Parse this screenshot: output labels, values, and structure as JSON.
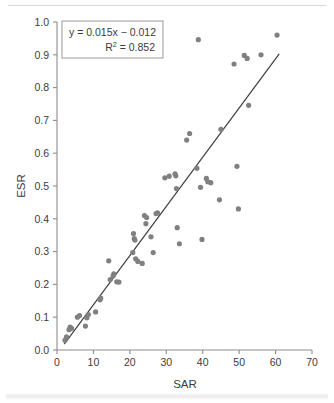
{
  "chart_data": {
    "type": "scatter",
    "title": "",
    "xlabel": "SAR",
    "ylabel": "ESR",
    "xlim": [
      0,
      70
    ],
    "ylim": [
      0.0,
      1.0
    ],
    "xticks": [
      "0",
      "10",
      "20",
      "30",
      "40",
      "50",
      "60",
      "70"
    ],
    "yticks": [
      "0.0",
      "0.1",
      "0.2",
      "0.3",
      "0.4",
      "0.5",
      "0.6",
      "0.7",
      "0.8",
      "0.9",
      "1.0"
    ],
    "xtick_values": [
      0,
      10,
      20,
      30,
      40,
      50,
      60,
      70
    ],
    "ytick_values": [
      0.0,
      0.1,
      0.2,
      0.3,
      0.4,
      0.5,
      0.6,
      0.7,
      0.8,
      0.9,
      1.0
    ],
    "grid": false,
    "legend": "none",
    "marker_color": "#808080",
    "marker_size_px": 5.2,
    "line_color": "#3a3a3a",
    "axis_color": "#8c8c8c",
    "annotation": {
      "equation_line1": "y = 0.015x − 0.012",
      "equation_r2_base": "R",
      "equation_r2_sup": "2",
      "equation_r2_value": "= 0.852",
      "slope": 0.015,
      "intercept": -0.012,
      "r_squared": 0.852,
      "box_x": 62,
      "box_y": 21,
      "box_w": 101,
      "box_h": 37
    },
    "fit_line": {
      "x_start": 2.0,
      "y_start": 0.018,
      "x_end": 61.0,
      "y_end": 0.903
    },
    "points": [
      [
        2.2,
        0.03
      ],
      [
        2.6,
        0.04
      ],
      [
        3.3,
        0.062
      ],
      [
        3.6,
        0.07
      ],
      [
        4.0,
        0.066
      ],
      [
        5.6,
        0.1
      ],
      [
        6.2,
        0.105
      ],
      [
        7.8,
        0.073
      ],
      [
        8.2,
        0.098
      ],
      [
        8.6,
        0.108
      ],
      [
        10.6,
        0.116
      ],
      [
        11.8,
        0.153
      ],
      [
        12.0,
        0.158
      ],
      [
        14.2,
        0.272
      ],
      [
        14.6,
        0.215
      ],
      [
        15.4,
        0.226
      ],
      [
        15.6,
        0.232
      ],
      [
        16.4,
        0.208
      ],
      [
        17.0,
        0.207
      ],
      [
        20.8,
        0.297
      ],
      [
        21.0,
        0.355
      ],
      [
        21.2,
        0.34
      ],
      [
        21.4,
        0.335
      ],
      [
        21.6,
        0.278
      ],
      [
        22.2,
        0.27
      ],
      [
        23.4,
        0.264
      ],
      [
        24.0,
        0.41
      ],
      [
        24.4,
        0.385
      ],
      [
        24.6,
        0.404
      ],
      [
        25.8,
        0.345
      ],
      [
        26.4,
        0.297
      ],
      [
        27.2,
        0.416
      ],
      [
        27.6,
        0.418
      ],
      [
        29.6,
        0.525
      ],
      [
        30.8,
        0.53
      ],
      [
        32.4,
        0.537
      ],
      [
        32.6,
        0.531
      ],
      [
        32.8,
        0.492
      ],
      [
        33.0,
        0.373
      ],
      [
        33.6,
        0.324
      ],
      [
        35.6,
        0.64
      ],
      [
        36.4,
        0.66
      ],
      [
        38.4,
        0.554
      ],
      [
        38.8,
        0.946
      ],
      [
        39.4,
        0.496
      ],
      [
        39.8,
        0.337
      ],
      [
        41.0,
        0.523
      ],
      [
        41.4,
        0.513
      ],
      [
        42.2,
        0.51
      ],
      [
        44.6,
        0.458
      ],
      [
        45.0,
        0.673
      ],
      [
        48.6,
        0.872
      ],
      [
        49.4,
        0.56
      ],
      [
        49.8,
        0.43
      ],
      [
        51.4,
        0.898
      ],
      [
        52.2,
        0.889
      ],
      [
        52.6,
        0.746
      ],
      [
        56.0,
        0.9
      ],
      [
        60.4,
        0.96
      ]
    ]
  }
}
